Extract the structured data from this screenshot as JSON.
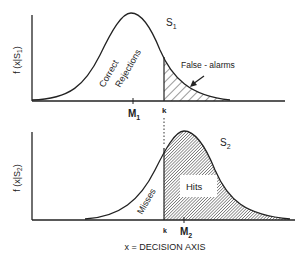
{
  "diagram": {
    "top_panel": {
      "y_axis_label": "f (x|S",
      "y_axis_sub": "1",
      "y_axis_close": ")",
      "curve_label": "S",
      "curve_sub": "1",
      "mean_label": "M",
      "mean_sub": "1",
      "criterion_label": "k",
      "region_left_line1": "Correct",
      "region_left_line2": "Rejections",
      "region_right": "False - alarms"
    },
    "bottom_panel": {
      "y_axis_label": "f (x|S",
      "y_axis_sub": "2",
      "y_axis_close": ")",
      "curve_label": "S",
      "curve_sub": "2",
      "mean_label": "M",
      "mean_sub": "2",
      "criterion_label": "k",
      "region_left": "Misses",
      "region_right": "Hits"
    },
    "x_axis_label": "x = DECISION AXIS"
  },
  "colors": {
    "line": "#222222",
    "hatch": "#333333",
    "background": "#ffffff"
  }
}
